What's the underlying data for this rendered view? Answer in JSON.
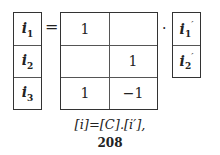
{
  "left_vector": {
    "entries": [
      {
        "base": "i",
        "sub": "1"
      },
      {
        "base": "i",
        "sub": "2"
      },
      {
        "base": "i",
        "sub": "3"
      }
    ]
  },
  "equals_sign": "=",
  "matrix_C": {
    "rows": [
      [
        "1",
        ""
      ],
      [
        "",
        "1"
      ],
      [
        "1",
        "−1"
      ]
    ]
  },
  "multiply_dot": "·",
  "right_vector": {
    "entries": [
      {
        "base": "i",
        "sub": "1",
        "prime": "′"
      },
      {
        "base": "i",
        "sub": "2",
        "prime": "′"
      }
    ]
  },
  "equation_caption": "[i]=[C].[i′],",
  "page_number": "208"
}
